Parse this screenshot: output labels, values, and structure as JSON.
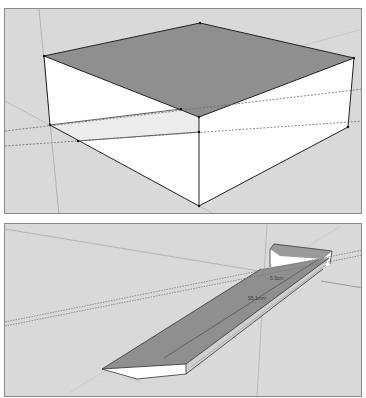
{
  "colors": {
    "background": "#d9d9d9",
    "frame": "#8a8a8a",
    "face_top": "#8f8f8f",
    "face_side": "#ffffff",
    "face_section": "#ececec",
    "edge": "#222222",
    "axis": "#a8a8a8",
    "guide": "#6a6a6a"
  },
  "viewports": [
    {
      "name": "box-view",
      "description": "3D box with section plane guides"
    },
    {
      "name": "ramp-view",
      "description": "3D ramp with dimension labels"
    }
  ],
  "dimensions": {
    "label_1": "5.0cm",
    "label_2": "55.1mm"
  }
}
